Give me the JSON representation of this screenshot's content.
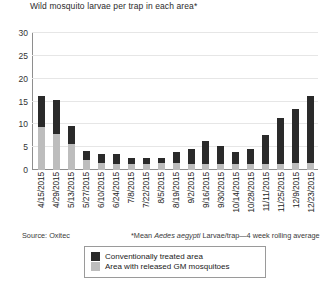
{
  "chart_data": {
    "type": "bar",
    "title": "Wild mosquito larvae per trap in each area*",
    "xlabel": "",
    "ylabel": "",
    "ylim": [
      0,
      30
    ],
    "yticks": [
      0,
      5,
      10,
      15,
      20,
      25,
      30
    ],
    "grid": true,
    "legend_position": "bottom-center",
    "stacked_overlap": true,
    "categories": [
      "4/15/2015",
      "4/29/2015",
      "5/13/2015",
      "5/27/2015",
      "6/10/2015",
      "6/24/2015",
      "7/8/2015",
      "7/22/2015",
      "8/5/2015",
      "8/19/2015",
      "9/2/2015",
      "9/16/2015",
      "9/30/2015",
      "10/14/2015",
      "10/28/2015",
      "11/11/2015",
      "11/25/2015",
      "12/9/2015",
      "12/23/2015"
    ],
    "series": [
      {
        "name": "Conventionally treated area",
        "color": "#2a2a2a",
        "values": [
          16.1,
          15.3,
          9.6,
          4.2,
          3.6,
          3.5,
          2.6,
          2.6,
          2.7,
          3.9,
          4.7,
          6.4,
          5.2,
          3.9,
          4.6,
          7.6,
          11.4,
          13.4,
          16.3
        ]
      },
      {
        "name": "Area with released GM mosquitoes",
        "color": "#bdbdbd",
        "values": [
          9.4,
          7.9,
          5.8,
          2.2,
          1.5,
          1.4,
          1.3,
          1.4,
          1.5,
          1.5,
          1.4,
          1.4,
          1.3,
          1.3,
          1.3,
          1.4,
          1.4,
          1.5,
          1.5
        ]
      }
    ],
    "totals": [
      16.1,
      15.3,
      9.6,
      4.2,
      3.6,
      3.5,
      2.6,
      2.6,
      2.7,
      3.9,
      4.7,
      6.4,
      5.2,
      3.9,
      4.6,
      7.6,
      11.4,
      13.4,
      16.3
    ]
  },
  "legend": {
    "entries": [
      {
        "label": "Conventionally treated area",
        "color": "#2a2a2a"
      },
      {
        "label": "Area with released GM mosquitoes",
        "color": "#bdbdbd"
      }
    ]
  },
  "notes": {
    "source": "Source: Oxitec",
    "footnote_prefix": "*Mean ",
    "footnote_italic": "Aedes aegypti",
    "footnote_suffix": " Larvae/trap—4 week rolling average"
  }
}
